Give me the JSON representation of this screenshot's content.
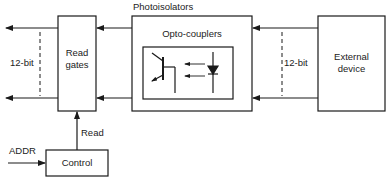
{
  "diagram": {
    "title": "Photoisolators",
    "blocks": {
      "read_gates": {
        "label_line1": "Read",
        "label_line2": "gates"
      },
      "photoisolators": {
        "label": "Opto-couplers"
      },
      "external_device": {
        "label_line1": "External",
        "label_line2": "device"
      },
      "control": {
        "label": "Control"
      }
    },
    "signals": {
      "left_bus": "12-bit",
      "right_bus": "12-bit",
      "read": "Read",
      "addr": "ADDR"
    },
    "colors": {
      "line": "#1a1a1a",
      "background": "#ffffff"
    }
  }
}
